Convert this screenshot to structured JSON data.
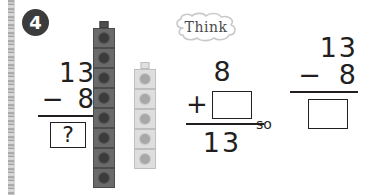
{
  "page": {
    "background_color": "#ffffff",
    "ink_color": "#231f20"
  },
  "binding": {
    "name": "page-binding-strip"
  },
  "exercise": {
    "number": "4",
    "badge_background": "#3c3c3c",
    "badge_text_color": "#ffffff"
  },
  "equation_left": {
    "minuend": "13",
    "operator": "−",
    "subtrahend": "8",
    "answer": "?"
  },
  "manipulatives": {
    "dark_tower": {
      "label": "dark-cube-tower",
      "count": 8,
      "cube_color": "#6a6a6a",
      "stud_color": "#3b3b3b"
    },
    "light_tower": {
      "label": "light-cube-tower",
      "count": 5,
      "cube_color": "#dedede",
      "stud_color": "#a8a8a8"
    }
  },
  "think_bubble": {
    "label": "Think",
    "text_color": "#4a4a4a",
    "outline_color": "#c9c9c9"
  },
  "equation_middle": {
    "addend": "8",
    "operator": "+",
    "missing_addend": "",
    "sum": "13"
  },
  "connector": {
    "word": "so"
  },
  "equation_right": {
    "minuend": "13",
    "operator": "−",
    "subtrahend": "8",
    "answer": ""
  }
}
